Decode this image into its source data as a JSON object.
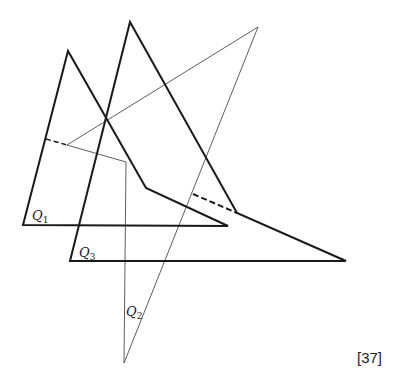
{
  "figure": {
    "reference": "[37]",
    "colors": {
      "thick_stroke": "#1a1a1a",
      "thin_stroke": "#333333",
      "background": "#ffffff"
    }
  },
  "quadrilaterals": [
    {
      "name": "Q1",
      "label_letter": "Q",
      "label_sub": "1",
      "points": [
        [
          23,
          225
        ],
        [
          68,
          51
        ],
        [
          146,
          188
        ],
        [
          228,
          226
        ]
      ],
      "label_pos": [
        32,
        220
      ]
    },
    {
      "name": "Q3",
      "label_letter": "Q",
      "label_sub": "3",
      "points": [
        [
          70,
          261
        ],
        [
          130,
          22
        ],
        [
          237,
          213
        ],
        [
          346,
          261
        ]
      ],
      "label_pos": [
        79,
        257
      ]
    },
    {
      "name": "Q2",
      "label_letter": "Q",
      "label_sub": "2",
      "points": [
        [
          67,
          145
        ],
        [
          258,
          27
        ],
        [
          124,
          363
        ],
        [
          126,
          162
        ]
      ],
      "label_pos": [
        126,
        316
      ]
    }
  ],
  "dashed_lines": [
    {
      "from": [
        46,
        139
      ],
      "to": [
        67,
        145
      ]
    },
    {
      "from": [
        193,
        194
      ],
      "to": [
        237,
        213
      ]
    }
  ]
}
